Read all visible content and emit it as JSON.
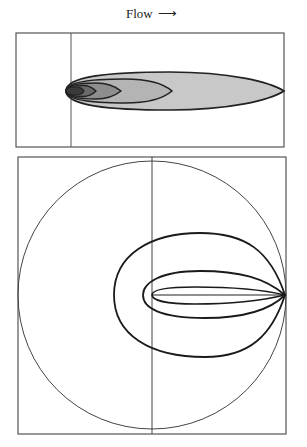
{
  "title": {
    "flow_label": "Flow",
    "arrow": "⟶"
  },
  "top_panel": {
    "description": "Concentration contours of a plume in flow (elongated nested ellipses)",
    "box": {
      "x": 16,
      "y": 33,
      "w": 268,
      "h": 114
    },
    "source_line_x": 71,
    "center_y": 91,
    "contours": [
      {
        "x0": 66,
        "x1": 284,
        "ry": 19,
        "fill": "#c8c8c8"
      },
      {
        "x0": 66,
        "x1": 172,
        "ry": 12,
        "fill": "#b4b4b4"
      },
      {
        "x0": 66,
        "x1": 121,
        "ry": 8,
        "fill": "#8e8e8e"
      },
      {
        "x0": 66,
        "x1": 96,
        "ry": 5.5,
        "fill": "#6a6a6a"
      },
      {
        "x0": 66,
        "x1": 84,
        "ry": 4,
        "fill": "#3a3a3a"
      }
    ]
  },
  "bottom_panel": {
    "description": "Contour loops converging at the right edge within a circle",
    "box": {
      "x": 18,
      "y": 157,
      "w": 268,
      "h": 277
    },
    "circle": {
      "cx": 152,
      "cy": 295,
      "r": 134
    },
    "center_line_x": 152,
    "axis_y": 295,
    "convergence": {
      "x": 285,
      "y": 295
    },
    "loops": [
      {
        "left_x": 114,
        "top_y": 233,
        "bottom_y": 357
      },
      {
        "left_x": 143,
        "top_y": 271,
        "bottom_y": 318
      },
      {
        "left_x": 152,
        "top_y": 287,
        "bottom_y": 304
      }
    ]
  }
}
